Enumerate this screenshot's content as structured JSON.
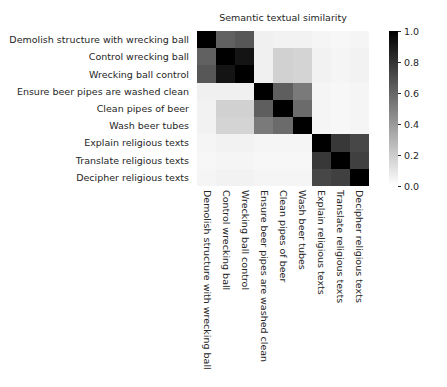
{
  "chart_data": {
    "type": "heatmap",
    "title": "Semantic textual similarity",
    "xlabel": "",
    "ylabel": "",
    "colormap": "gray_r",
    "vmin": 0.0,
    "vmax": 1.0,
    "grid": false,
    "legend_position": "right-colorbar",
    "colorbar": {
      "orientation": "vertical",
      "position": "right",
      "ticks": [
        "1.0",
        "0.8",
        "0.6",
        "0.4",
        "0.2",
        "0.0"
      ],
      "tick_values": [
        1.0,
        0.8,
        0.6,
        0.4,
        0.2,
        0.0
      ],
      "min_label": "0.0",
      "max_label": "1.0"
    },
    "categories": [
      "Demolish structure with wrecking ball",
      "Control wrecking ball",
      "Wrecking ball control",
      "Ensure beer pipes are washed clean",
      "Clean pipes of beer",
      "Wash beer tubes",
      "Explain religious texts",
      "Translate religious texts",
      "Decipher religious texts"
    ],
    "x": [
      "Demolish structure with wrecking ball",
      "Control wrecking ball",
      "Wrecking ball control",
      "Ensure beer pipes are washed clean",
      "Clean pipes of beer",
      "Wash beer tubes",
      "Explain religious texts",
      "Translate religious texts",
      "Decipher religious texts"
    ],
    "y": [
      "Demolish structure with wrecking ball",
      "Control wrecking ball",
      "Wrecking ball control",
      "Ensure beer pipes are washed clean",
      "Clean pipes of beer",
      "Wash beer tubes",
      "Explain religious texts",
      "Translate religious texts",
      "Decipher religious texts"
    ],
    "values": [
      [
        1.0,
        0.62,
        0.66,
        0.06,
        0.05,
        0.05,
        0.04,
        0.03,
        0.04
      ],
      [
        0.62,
        1.0,
        0.92,
        0.06,
        0.18,
        0.17,
        0.05,
        0.04,
        0.05
      ],
      [
        0.66,
        0.92,
        1.0,
        0.06,
        0.18,
        0.17,
        0.05,
        0.04,
        0.05
      ],
      [
        0.06,
        0.06,
        0.06,
        1.0,
        0.63,
        0.52,
        0.04,
        0.03,
        0.04
      ],
      [
        0.05,
        0.18,
        0.18,
        0.63,
        1.0,
        0.58,
        0.04,
        0.03,
        0.04
      ],
      [
        0.05,
        0.17,
        0.17,
        0.52,
        0.58,
        1.0,
        0.04,
        0.03,
        0.04
      ],
      [
        0.04,
        0.05,
        0.05,
        0.04,
        0.04,
        0.04,
        1.0,
        0.78,
        0.72
      ],
      [
        0.03,
        0.04,
        0.04,
        0.03,
        0.03,
        0.03,
        0.78,
        1.0,
        0.75
      ],
      [
        0.04,
        0.05,
        0.05,
        0.04,
        0.04,
        0.04,
        0.72,
        0.75,
        1.0
      ]
    ]
  }
}
